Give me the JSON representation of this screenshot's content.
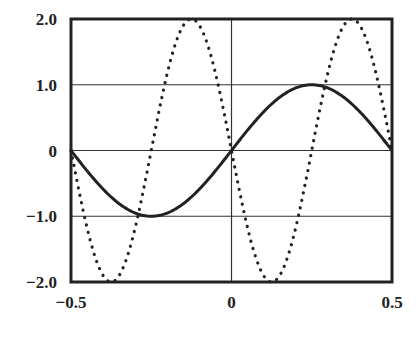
{
  "chart_data": {
    "type": "line",
    "title": "",
    "xlabel": "",
    "ylabel": "",
    "xlim": [
      -0.5,
      0.5
    ],
    "ylim": [
      -2.0,
      2.0
    ],
    "grid": true,
    "legend": null,
    "x_ticks": [
      -0.5,
      0,
      0.5
    ],
    "x_tick_labels": [
      "−0.5",
      "0",
      "0.5"
    ],
    "y_ticks": [
      2.0,
      1.0,
      0,
      -1.0,
      -2.0
    ],
    "y_tick_labels": [
      "2.0",
      "1.0",
      "0",
      "−1.0",
      "−2.0"
    ],
    "series": [
      {
        "name": "solid",
        "style": "solid",
        "color": "#222222",
        "formula": "sin(2*pi*x)",
        "x": [
          -0.5,
          -0.375,
          -0.25,
          -0.125,
          0,
          0.125,
          0.25,
          0.375,
          0.5
        ],
        "values": [
          0,
          -0.71,
          -1.0,
          -0.71,
          0,
          0.71,
          1.0,
          0.71,
          0
        ]
      },
      {
        "name": "dotted",
        "style": "dotted",
        "color": "#222222",
        "formula": "-2*sin(4*pi*x)",
        "x": [
          -0.5,
          -0.375,
          -0.25,
          -0.125,
          0,
          0.125,
          0.25,
          0.375,
          0.5
        ],
        "values": [
          0,
          -2.0,
          0,
          2.0,
          0,
          -2.0,
          0,
          2.0,
          0
        ]
      }
    ]
  }
}
